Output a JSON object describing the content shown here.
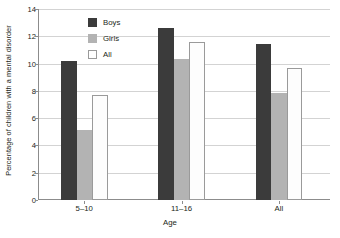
{
  "chart_data": {
    "type": "bar",
    "title": "",
    "xlabel": "Age",
    "ylabel": "Percentage of children with a mental disorder",
    "categories": [
      "5–10",
      "11–16",
      "All"
    ],
    "series": [
      {
        "name": "Boys",
        "color": "#3b3b3b",
        "values": [
          10.2,
          12.6,
          11.45
        ]
      },
      {
        "name": "Girls",
        "color": "#b3b3b3",
        "values": [
          5.15,
          10.35,
          7.85
        ]
      },
      {
        "name": "All",
        "color": "#ffffff",
        "values": [
          7.7,
          11.55,
          9.65
        ]
      }
    ],
    "ylim": [
      0,
      14
    ],
    "yticks": [
      0,
      2,
      4,
      6,
      8,
      10,
      12,
      14
    ],
    "ytick_labels": [
      "0",
      "2",
      "4",
      "6",
      "8",
      "10",
      "12",
      "14"
    ],
    "grid": true,
    "legend_position": "upper-left-inside"
  },
  "axes": {
    "y_title": "Percentage of children with a mental disorder",
    "x_title": "Age"
  },
  "legend": {
    "items": [
      {
        "label": "Boys"
      },
      {
        "label": "Girls"
      },
      {
        "label": "All"
      }
    ]
  }
}
